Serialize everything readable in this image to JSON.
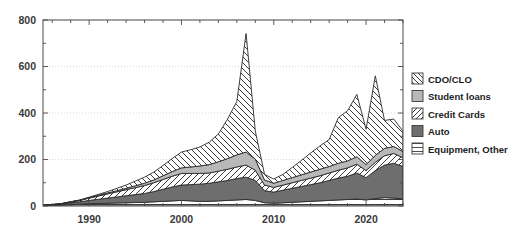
{
  "chart_data": {
    "type": "area",
    "stacked": true,
    "title": "",
    "subtitle": "",
    "xlabel": "",
    "ylabel": "",
    "xlim": [
      1985,
      2024
    ],
    "ylim": [
      0,
      800
    ],
    "yticks": [
      0,
      200,
      400,
      600,
      800
    ],
    "ytick_labels": [
      "0",
      "200",
      "400",
      "600",
      "800"
    ],
    "yminor_step": 100,
    "xticks": [
      1990,
      2000,
      2010,
      2020
    ],
    "xtick_labels": [
      "1990",
      "2000",
      "2010",
      "2020"
    ],
    "xminor_step": 2,
    "grid": "horizontal-dotted",
    "legend_position": "right",
    "x": [
      1985,
      1986,
      1987,
      1988,
      1989,
      1990,
      1991,
      1992,
      1993,
      1994,
      1995,
      1996,
      1997,
      1998,
      1999,
      2000,
      2001,
      2002,
      2003,
      2004,
      2005,
      2006,
      2007,
      2008,
      2009,
      2010,
      2011,
      2012,
      2013,
      2014,
      2015,
      2016,
      2017,
      2018,
      2019,
      2020,
      2021,
      2022,
      2023,
      2024
    ],
    "series": [
      {
        "name": "Equipment, Other",
        "fill": "#ffffff",
        "pattern": "horizontal-lines",
        "values": [
          2,
          3,
          4,
          6,
          8,
          10,
          11,
          12,
          13,
          14,
          15,
          16,
          18,
          20,
          22,
          24,
          22,
          20,
          20,
          22,
          24,
          26,
          28,
          24,
          14,
          12,
          14,
          16,
          18,
          20,
          22,
          24,
          26,
          28,
          30,
          26,
          32,
          36,
          34,
          30
        ]
      },
      {
        "name": "Auto",
        "fill": "#6e6e6e",
        "pattern": "solid",
        "values": [
          1,
          2,
          4,
          7,
          10,
          14,
          18,
          22,
          26,
          30,
          34,
          38,
          44,
          52,
          60,
          66,
          70,
          74,
          78,
          82,
          86,
          92,
          96,
          86,
          52,
          48,
          54,
          60,
          66,
          72,
          78,
          86,
          94,
          100,
          112,
          96,
          120,
          140,
          150,
          140
        ]
      },
      {
        "name": "Credit Cards",
        "fill": "#ffffff",
        "pattern": "diagonal-forward",
        "values": [
          0,
          1,
          2,
          4,
          6,
          10,
          14,
          18,
          22,
          26,
          30,
          34,
          38,
          42,
          46,
          50,
          48,
          46,
          44,
          46,
          48,
          50,
          52,
          44,
          24,
          20,
          22,
          24,
          26,
          28,
          30,
          32,
          34,
          36,
          38,
          30,
          36,
          40,
          42,
          38
        ]
      },
      {
        "name": "Student loans",
        "fill": "#b8b8b8",
        "pattern": "solid",
        "values": [
          0,
          0,
          0,
          1,
          1,
          2,
          3,
          4,
          5,
          6,
          8,
          10,
          12,
          16,
          20,
          24,
          28,
          32,
          36,
          40,
          46,
          52,
          56,
          48,
          22,
          18,
          20,
          22,
          24,
          26,
          28,
          28,
          30,
          30,
          32,
          26,
          30,
          32,
          30,
          26
        ]
      },
      {
        "name": "CDO/CLO",
        "fill": "#ffffff",
        "pattern": "diagonal-back",
        "values": [
          0,
          0,
          0,
          0,
          1,
          2,
          4,
          6,
          10,
          14,
          20,
          26,
          34,
          44,
          56,
          68,
          74,
          82,
          96,
          120,
          170,
          230,
          510,
          120,
          24,
          18,
          26,
          44,
          62,
          82,
          100,
          116,
          196,
          216,
          268,
          152,
          342,
          120,
          118,
          88
        ]
      }
    ],
    "peaks": [
      {
        "year": 2007,
        "total": 790
      },
      {
        "year": 2021,
        "total": 580
      },
      {
        "year": 2019,
        "total": 480
      }
    ]
  },
  "legend": {
    "items": [
      {
        "label": "CDO/CLO",
        "swatch": "diagonal-back"
      },
      {
        "label": "Student loans",
        "swatch": "solid-light"
      },
      {
        "label": "Credit Cards",
        "swatch": "diagonal-forward"
      },
      {
        "label": "Auto",
        "swatch": "solid-dark"
      },
      {
        "label": "Equipment, Other",
        "swatch": "horizontal-lines"
      }
    ]
  },
  "colors": {
    "auto": "#6e6e6e",
    "student_loans": "#b8b8b8",
    "outline": "#2b2b2b",
    "axis": "#4a4a4a",
    "grid": "#c8c8c8",
    "text": "#1d1d1d"
  }
}
